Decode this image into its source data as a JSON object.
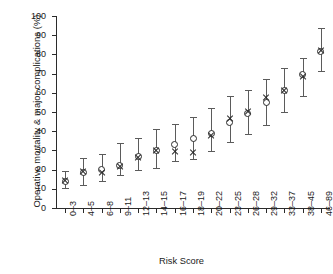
{
  "chart_data": {
    "type": "scatter",
    "title": "",
    "xlabel": "Risk Score",
    "ylabel": "Operative mortality & major complications (%)",
    "ylim": [
      0,
      100
    ],
    "yticks": [
      0,
      10,
      20,
      30,
      40,
      50,
      60,
      70,
      80,
      90,
      100
    ],
    "grid": false,
    "legend": "none",
    "categories": [
      "0–3",
      "4–5",
      "6–8",
      "9–11",
      "12–13",
      "14–15",
      "16–17",
      "18–19",
      "20–22",
      "23–25",
      "26–28",
      "29–32",
      "33–37",
      "38–45",
      "46–89"
    ],
    "series": [
      {
        "name": "Observed",
        "marker": "open-circle",
        "values": [
          14.0,
          18.5,
          20.3,
          22.3,
          26.8,
          29.7,
          33.3,
          36.0,
          39.0,
          44.5,
          49.0,
          55.2,
          61.0,
          69.5,
          81.5
        ],
        "ci_low": [
          10.2,
          12.2,
          14.2,
          17.2,
          19.6,
          21.0,
          24.4,
          25.7,
          29.5,
          34.2,
          38.6,
          43.0,
          50.2,
          58.3,
          71.4
        ],
        "ci_high": [
          19.2,
          26.3,
          28.0,
          33.8,
          36.4,
          41.1,
          43.9,
          47.4,
          52.0,
          58.4,
          61.7,
          67.3,
          72.9,
          78.2,
          93.8
        ]
      },
      {
        "name": "Predicted",
        "marker": "x",
        "values": [
          14.1,
          18.8,
          18.4,
          21.3,
          26.3,
          29.9,
          29.3,
          28.8,
          37.7,
          46.6,
          50.3,
          57.6,
          61.2,
          68.4,
          82.1
        ]
      }
    ]
  }
}
